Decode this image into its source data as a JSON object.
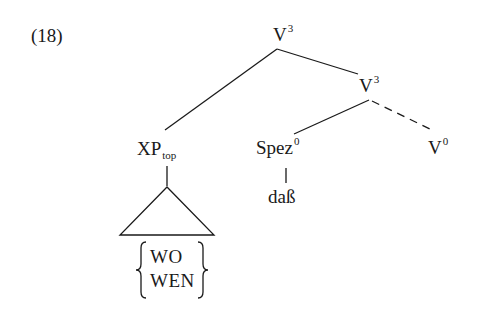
{
  "example_number": "(18)",
  "tree": {
    "root": {
      "base": "V",
      "sup": "3"
    },
    "intermediate": {
      "base": "V",
      "sup": "3"
    },
    "topic": {
      "base": "XP",
      "sub": "top"
    },
    "spec": {
      "base": "Spez",
      "sup": "0"
    },
    "head": {
      "base": "V",
      "sup": "0"
    },
    "spec_terminal": "daß",
    "topic_alternatives": [
      "WO",
      "WEN"
    ]
  },
  "edges": [
    {
      "from": "V3-root",
      "to": "XP_top",
      "style": "solid"
    },
    {
      "from": "V3-root",
      "to": "V3",
      "style": "solid"
    },
    {
      "from": "V3",
      "to": "Spez0",
      "style": "solid"
    },
    {
      "from": "V3",
      "to": "V0",
      "style": "dashed"
    },
    {
      "from": "Spez0",
      "to": "daß",
      "style": "solid"
    },
    {
      "from": "XP_top",
      "to": "triangle",
      "style": "solid"
    }
  ],
  "colors": {
    "ink": "#1a1a1a",
    "background": "#ffffff"
  }
}
